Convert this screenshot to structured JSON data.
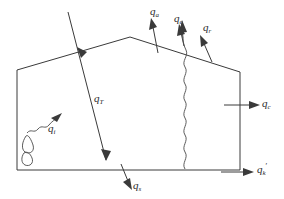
{
  "figure": {
    "name": "energy-flux-diagram",
    "background_color": "#ffffff",
    "line_color": "#3a3a3a",
    "text_color": "#2b2b2b"
  },
  "labels": {
    "q_a": {
      "symbol": "q",
      "subscript": "a",
      "prime": ""
    },
    "q_e": {
      "symbol": "q",
      "subscript": "e",
      "prime": ""
    },
    "q_r": {
      "symbol": "q",
      "subscript": "r",
      "prime": ""
    },
    "q_T": {
      "symbol": "q",
      "subscript": "T",
      "prime": ""
    },
    "q_c": {
      "symbol": "q",
      "subscript": "c",
      "prime": ""
    },
    "q_s": {
      "symbol": "q",
      "subscript": "s",
      "prime": ""
    },
    "q_i": {
      "symbol": "q",
      "subscript": "i",
      "prime": ""
    },
    "q_k_prime": {
      "symbol": "q",
      "subscript": "k",
      "prime": "′"
    }
  },
  "elements": {
    "body_outline": "polygon-body",
    "incident_ray": "incident-flux-ray",
    "wavy_ray": "wavy-flux-ray",
    "cavity": "surface-cavity",
    "squiggle": "scattered-flux-squiggle"
  }
}
